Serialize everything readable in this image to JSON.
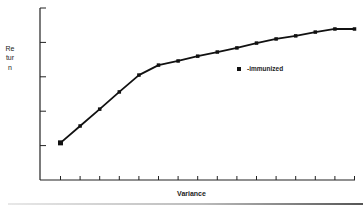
{
  "chart_data": {
    "type": "line",
    "title": "",
    "xlabel": "Variance",
    "ylabel": "Return",
    "x": [
      1,
      2,
      3,
      4,
      5,
      6,
      7,
      8,
      9,
      10,
      11,
      12,
      13,
      14,
      15,
      16
    ],
    "series": [
      {
        "name": "-immunized",
        "marker": "square",
        "values": [
          1.08,
          1.57,
          2.06,
          2.56,
          3.05,
          3.34,
          3.46,
          3.6,
          3.72,
          3.84,
          3.98,
          4.1,
          4.19,
          4.3,
          4.39,
          4.39
        ]
      }
    ],
    "ylim": [
      0,
      5
    ],
    "xlim": [
      0,
      16
    ],
    "y_ticks": [
      0,
      1,
      2,
      3,
      4,
      5
    ],
    "x_tick_count": 16,
    "tick_labels_shown": false,
    "grid": false,
    "legend_position": "inside-center-right"
  },
  "labels": {
    "ylabel": "Return",
    "xlabel": "Variance",
    "legend": "-immunized"
  },
  "colors": {
    "line": "#111111",
    "axis": "#222222",
    "background": "#ffffff"
  }
}
